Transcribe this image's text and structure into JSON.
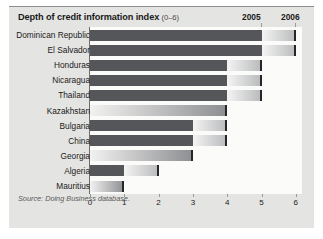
{
  "header": {
    "title": "Depth of credit information index",
    "title_range": "(0–6)",
    "year_left": "2005",
    "year_right": "2006"
  },
  "source": "Source: Doing Business database.",
  "chart_data": {
    "type": "bar",
    "orientation": "horizontal",
    "title": "Depth of credit information index (0–6)",
    "xlabel": "",
    "ylabel": "",
    "xlim": [
      0,
      6
    ],
    "xticks": [
      0,
      1,
      2,
      3,
      4,
      5,
      6
    ],
    "xtick_labels": [
      "0",
      "1",
      "2",
      "3",
      "4",
      "5",
      "6"
    ],
    "grid": false,
    "legend_position": "top-right",
    "categories": [
      "Dominican Republic",
      "El Salvador",
      "Honduras",
      "Nicaragua",
      "Thailand",
      "Kazakhstan",
      "Bulgaria",
      "China",
      "Georgia",
      "Algeria",
      "Mauritius"
    ],
    "series": [
      {
        "name": "2005",
        "values": [
          5,
          5,
          4,
          4,
          4,
          0,
          3,
          3,
          0,
          1,
          0
        ]
      },
      {
        "name": "2006",
        "values": [
          6,
          6,
          5,
          5,
          5,
          4,
          4,
          4,
          3,
          2,
          1
        ]
      }
    ]
  },
  "colors": {
    "bar_2005": "#55565a",
    "bar_2006_cap": "#26262a",
    "panel": "#e4e4e2",
    "plot_background": "#fbfbfa"
  }
}
